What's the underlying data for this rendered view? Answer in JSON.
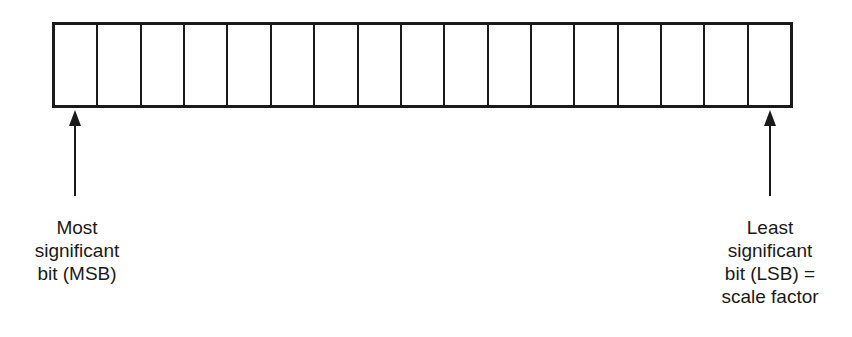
{
  "register": {
    "cell_count": 17
  },
  "labels": {
    "msb": [
      "Most",
      "significant",
      "bit (MSB)"
    ],
    "lsb": [
      "Least",
      "significant",
      "bit (LSB) =",
      "scale factor"
    ]
  }
}
